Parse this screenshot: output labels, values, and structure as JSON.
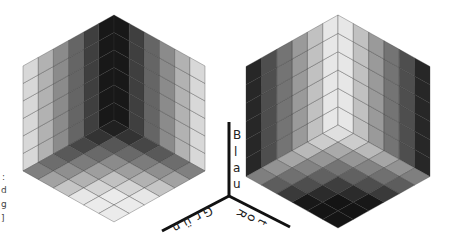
{
  "figure": {
    "grid_divisions": 6,
    "grid_line_color": "#333333"
  },
  "cubes": [
    {
      "name": "dark-corner-cube",
      "apex_x": 114,
      "apex_y": 15,
      "half_width": 91,
      "edge_height": 105,
      "corner_gray": 5,
      "far_gray": 235
    },
    {
      "name": "light-corner-cube",
      "apex_x": 338,
      "apex_y": 15,
      "half_width": 92,
      "edge_height": 110,
      "corner_gray": 250,
      "far_gray": 20
    }
  ],
  "axes": {
    "origin": {
      "x": 229,
      "y": 196
    },
    "blue_label": "Blau",
    "green_label": "Grün",
    "red_label": "Rot",
    "blue_letters": [
      "B",
      "l",
      "a",
      "u"
    ],
    "green_letters": [
      "G",
      "r",
      "ü",
      "n"
    ],
    "red_letters": [
      "R",
      "o",
      "t"
    ]
  },
  "side_text": {
    "letters": [
      ":",
      "d",
      "g",
      "]"
    ]
  }
}
